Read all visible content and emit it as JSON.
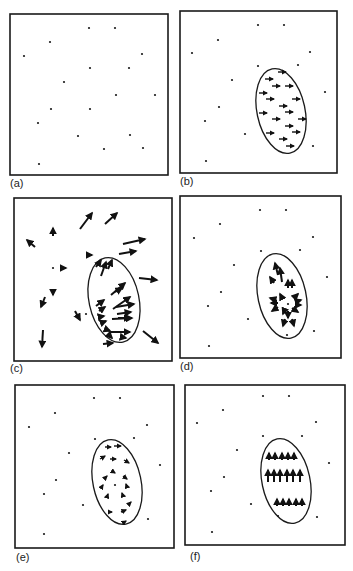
{
  "figure": {
    "width": 353,
    "height": 571,
    "colors": {
      "ink": "#1a1a1a",
      "background": "#ffffff"
    },
    "panels": [
      {
        "id": "a",
        "label": "(a)",
        "label_pos": [
          10,
          187
        ],
        "box": [
          10,
          14,
          158,
          161
        ],
        "dots": [
          [
            89,
            28
          ],
          [
            115,
            28
          ],
          [
            50,
            42
          ],
          [
            24,
            56
          ],
          [
            142,
            54
          ],
          [
            90,
            68
          ],
          [
            129,
            68
          ],
          [
            64,
            82
          ],
          [
            116,
            95
          ],
          [
            155,
            95
          ],
          [
            51,
            109
          ],
          [
            90,
            109
          ],
          [
            38,
            123
          ],
          [
            78,
            136
          ],
          [
            130,
            135
          ],
          [
            104,
            149
          ],
          [
            143,
            148
          ],
          [
            39,
            164
          ]
        ],
        "ellipse": null,
        "arrows": []
      },
      {
        "id": "b",
        "label": "(b)",
        "label_pos": [
          180,
          185
        ],
        "box": [
          180,
          11,
          157,
          162
        ],
        "dots": [
          [
            258,
            25
          ],
          [
            284,
            25
          ],
          [
            218,
            40
          ],
          [
            192,
            53
          ],
          [
            310,
            52
          ],
          [
            258,
            66
          ],
          [
            298,
            65
          ],
          [
            232,
            80
          ],
          [
            325,
            92
          ],
          [
            219,
            107
          ],
          [
            205,
            121
          ],
          [
            245,
            134
          ],
          [
            313,
            146
          ],
          [
            206,
            161
          ]
        ],
        "ellipse": {
          "cx": 281,
          "cy": 111,
          "rx": 24,
          "ry": 43,
          "rot": -12
        },
        "arrows": [
          [
            278,
            72,
            286,
            72
          ],
          [
            265,
            79,
            273,
            79
          ],
          [
            272,
            86,
            280,
            86
          ],
          [
            285,
            86,
            293,
            86
          ],
          [
            259,
            93,
            267,
            93
          ],
          [
            266,
            99,
            274,
            99
          ],
          [
            292,
            99,
            300,
            99
          ],
          [
            279,
            106,
            287,
            106
          ],
          [
            259,
            113,
            267,
            113
          ],
          [
            285,
            112,
            293,
            112
          ],
          [
            272,
            119,
            280,
            119
          ],
          [
            298,
            119,
            306,
            119
          ],
          [
            285,
            126,
            293,
            126
          ],
          [
            266,
            133,
            274,
            133
          ],
          [
            292,
            132,
            300,
            132
          ],
          [
            279,
            139,
            287,
            139
          ],
          [
            286,
            146,
            294,
            146
          ]
        ],
        "arrow_style": "arr"
      },
      {
        "id": "c",
        "label": "(c)",
        "label_pos": [
          10,
          372
        ],
        "box": [
          14,
          198,
          158,
          163
        ],
        "dots": [
          [
            53,
            268
          ],
          [
            86,
            314
          ]
        ],
        "ellipse": {
          "cx": 114,
          "cy": 300,
          "rx": 25,
          "ry": 43,
          "rot": -12
        },
        "arrows": [
          [
            80,
            229,
            92,
            213
          ],
          [
            105,
            224,
            117,
            213
          ],
          [
            53,
            236,
            53,
            228
          ],
          [
            35,
            247,
            27,
            240
          ],
          [
            123,
            244,
            145,
            239
          ],
          [
            119,
            254,
            136,
            251
          ],
          [
            86,
            255,
            92,
            255
          ],
          [
            60,
            268,
            66,
            268
          ],
          [
            139,
            278,
            157,
            280
          ],
          [
            53,
            289,
            53,
            295
          ],
          [
            45,
            297,
            41,
            307
          ],
          [
            75,
            311,
            80,
            320
          ],
          [
            43,
            330,
            42,
            347
          ],
          [
            143,
            331,
            158,
            343
          ],
          [
            96,
            267,
            101,
            260
          ],
          [
            101,
            276,
            106,
            262
          ],
          [
            108,
            269,
            112,
            260
          ],
          [
            111,
            295,
            125,
            283
          ],
          [
            115,
            292,
            122,
            288
          ],
          [
            113,
            309,
            130,
            297
          ],
          [
            116,
            307,
            134,
            304
          ],
          [
            117,
            314,
            131,
            312
          ],
          [
            118,
            318,
            130,
            318
          ],
          [
            112,
            319,
            132,
            318
          ],
          [
            96,
            306,
            104,
            300
          ],
          [
            99,
            311,
            105,
            307
          ],
          [
            99,
            317,
            104,
            316
          ],
          [
            101,
            323,
            106,
            321
          ],
          [
            105,
            329,
            110,
            331
          ],
          [
            108,
            334,
            112,
            338
          ],
          [
            121,
            337,
            126,
            338
          ],
          [
            103,
            344,
            113,
            343
          ],
          [
            110,
            332,
            130,
            332
          ]
        ],
        "arrow_style": "arrbold"
      },
      {
        "id": "d",
        "label": "(d)",
        "label_pos": [
          180,
          370
        ],
        "box": [
          180,
          196,
          161,
          162
        ],
        "dots": [
          [
            260,
            210
          ],
          [
            286,
            210
          ],
          [
            220,
            224
          ],
          [
            194,
            238
          ],
          [
            313,
            237
          ],
          [
            261,
            251
          ],
          [
            300,
            250
          ],
          [
            234,
            265
          ],
          [
            327,
            277
          ],
          [
            221,
            292
          ],
          [
            208,
            306
          ],
          [
            248,
            319
          ],
          [
            314,
            331
          ],
          [
            209,
            346
          ],
          [
            287,
            335
          ],
          [
            288,
            304
          ]
        ],
        "ellipse": {
          "cx": 282,
          "cy": 296,
          "rx": 24,
          "ry": 43,
          "rot": -12
        },
        "arrows": [
          [
            278,
            275,
            275,
            263
          ],
          [
            282,
            282,
            280,
            268
          ],
          [
            274,
            283,
            270,
            277
          ],
          [
            288,
            288,
            288,
            280
          ],
          [
            292,
            288,
            292,
            280
          ],
          [
            276,
            300,
            270,
            298
          ],
          [
            278,
            303,
            271,
            303
          ],
          [
            278,
            307,
            272,
            311
          ],
          [
            282,
            298,
            280,
            294
          ],
          [
            285,
            309,
            283,
            314
          ],
          [
            294,
            298,
            298,
            294
          ],
          [
            295,
            302,
            301,
            300
          ],
          [
            295,
            305,
            301,
            305
          ],
          [
            292,
            308,
            298,
            312
          ],
          [
            285,
            319,
            283,
            326
          ],
          [
            292,
            319,
            294,
            326
          ],
          [
            288,
            311,
            288,
            318
          ]
        ],
        "arrow_style": "arrbold"
      },
      {
        "id": "e",
        "label": "(e)",
        "label_pos": [
          16,
          561
        ],
        "box": [
          15,
          385,
          159,
          163
        ],
        "dots": [
          [
            94,
            398
          ],
          [
            120,
            398
          ],
          [
            55,
            413
          ],
          [
            29,
            427
          ],
          [
            147,
            425
          ],
          [
            95,
            439
          ],
          [
            134,
            438
          ],
          [
            69,
            453
          ],
          [
            160,
            465
          ],
          [
            56,
            480
          ],
          [
            44,
            494
          ],
          [
            83,
            505
          ],
          [
            148,
            519
          ],
          [
            44,
            534
          ],
          [
            115,
            485
          ]
        ],
        "ellipse": {
          "cx": 117,
          "cy": 482,
          "rx": 24,
          "ry": 43,
          "rot": -12
        },
        "arrows": [
          [
            105,
            447,
            111,
            447
          ],
          [
            114,
            446,
            121,
            446
          ],
          [
            100,
            459,
            105,
            456
          ],
          [
            110,
            459,
            116,
            459
          ],
          [
            124,
            460,
            129,
            463
          ],
          [
            112,
            471,
            115,
            473
          ],
          [
            104,
            479,
            107,
            476
          ],
          [
            123,
            476,
            127,
            479
          ],
          [
            101,
            488,
            103,
            485
          ],
          [
            127,
            487,
            126,
            484
          ],
          [
            107,
            497,
            108,
            494
          ],
          [
            123,
            496,
            122,
            493
          ],
          [
            108,
            512,
            112,
            512
          ],
          [
            121,
            512,
            126,
            510
          ],
          [
            128,
            505,
            131,
            502
          ],
          [
            123,
            523,
            126,
            521
          ]
        ],
        "arrow_style": "arr"
      },
      {
        "id": "f",
        "label": "(f)",
        "label_pos": [
          190,
          560
        ],
        "box": [
          185,
          385,
          160,
          160
        ],
        "dots": [
          [
            263,
            396
          ],
          [
            289,
            396
          ],
          [
            223,
            410
          ],
          [
            197,
            423
          ],
          [
            316,
            422
          ],
          [
            263,
            436
          ],
          [
            302,
            436
          ],
          [
            237,
            450
          ],
          [
            329,
            463
          ],
          [
            224,
            477
          ],
          [
            211,
            491
          ],
          [
            251,
            504
          ],
          [
            317,
            517
          ],
          [
            212,
            532
          ],
          [
            278,
            516
          ]
        ],
        "ellipse": {
          "cx": 286,
          "cy": 481,
          "rx": 24,
          "ry": 43,
          "rot": -12
        },
        "arrows": [
          [
            269,
            460,
            269,
            453
          ],
          [
            275,
            460,
            275,
            453
          ],
          [
            282,
            460,
            282,
            453
          ],
          [
            288,
            460,
            288,
            453
          ],
          [
            294,
            460,
            294,
            453
          ],
          [
            268,
            482,
            268,
            470
          ],
          [
            274,
            482,
            274,
            470
          ],
          [
            280,
            482,
            280,
            470
          ],
          [
            287,
            482,
            287,
            470
          ],
          [
            293,
            482,
            293,
            470
          ],
          [
            300,
            482,
            300,
            470
          ],
          [
            277,
            506,
            277,
            499
          ],
          [
            283,
            506,
            283,
            499
          ],
          [
            289,
            506,
            289,
            499
          ],
          [
            296,
            506,
            296,
            499
          ],
          [
            302,
            506,
            302,
            499
          ]
        ],
        "arrow_style": "arrbold"
      }
    ]
  }
}
